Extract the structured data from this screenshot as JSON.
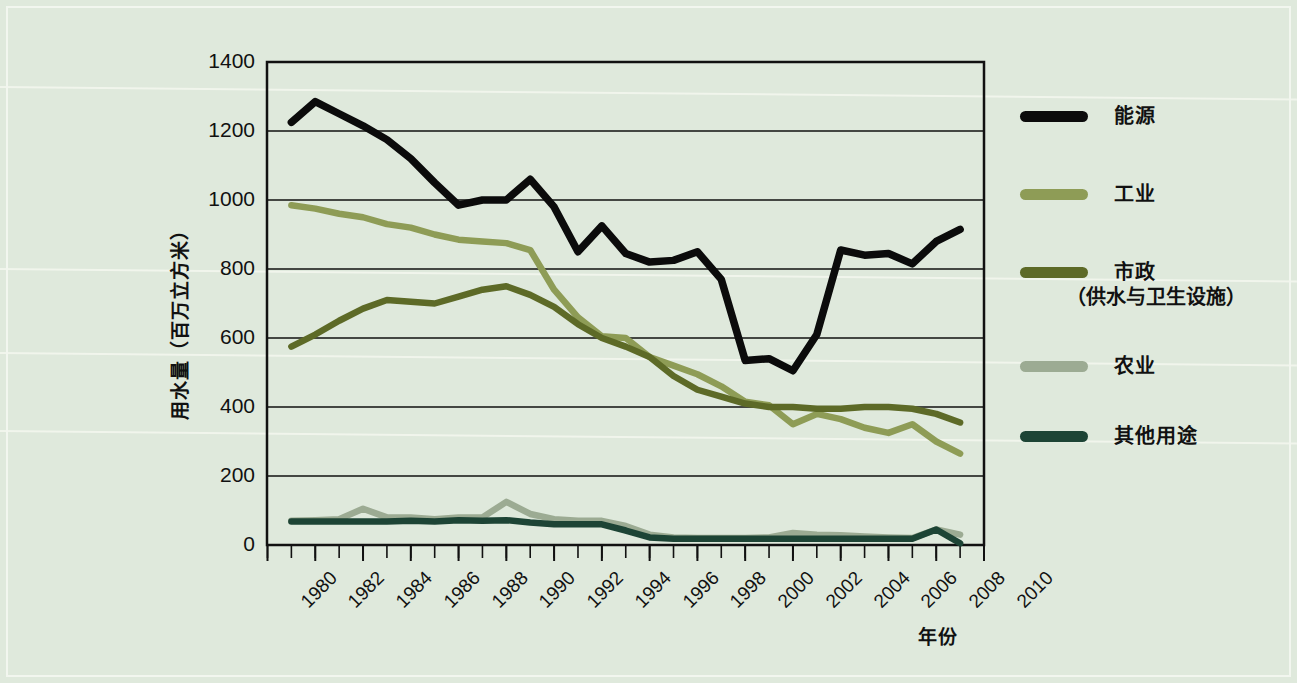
{
  "chart_data": {
    "type": "line",
    "title": "",
    "xlabel": "年份",
    "ylabel": "用水量（百万立方米）",
    "xlim": [
      1980,
      2010
    ],
    "ylim": [
      0,
      1400
    ],
    "ytick_labels": [
      "0",
      "200",
      "400",
      "600",
      "800",
      "1000",
      "1200",
      "1400"
    ],
    "ytick_values": [
      0,
      200,
      400,
      600,
      800,
      1000,
      1200,
      1400
    ],
    "xtick_labels": [
      "1980",
      "1982",
      "1984",
      "1986",
      "1988",
      "1990",
      "1992",
      "1994",
      "1996",
      "1998",
      "2000",
      "2002",
      "2004",
      "2006",
      "2008",
      "2010"
    ],
    "xtick_values": [
      1980,
      1982,
      1984,
      1986,
      1988,
      1990,
      1992,
      1994,
      1996,
      1998,
      2000,
      2002,
      2004,
      2006,
      2008,
      2010
    ],
    "minor_xticks_every": 1,
    "grid": "horizontal-only",
    "legend_position": "right",
    "x": [
      1981,
      1982,
      1983,
      1984,
      1985,
      1986,
      1987,
      1988,
      1989,
      1990,
      1991,
      1992,
      1993,
      1994,
      1995,
      1996,
      1997,
      1998,
      1999,
      2000,
      2001,
      2002,
      2003,
      2004,
      2005,
      2006,
      2007,
      2008,
      2009
    ],
    "series": [
      {
        "name": "能源",
        "color": "#0b0b0b",
        "values": [
          1225,
          1285,
          1250,
          1215,
          1175,
          1120,
          1050,
          985,
          1000,
          1000,
          1060,
          980,
          850,
          925,
          845,
          820,
          825,
          850,
          770,
          535,
          540,
          505,
          610,
          855,
          840,
          845,
          815,
          880,
          915
        ]
      },
      {
        "name": "工业",
        "color": "#8e9c56",
        "values": [
          985,
          975,
          960,
          950,
          930,
          920,
          900,
          885,
          880,
          875,
          855,
          740,
          660,
          605,
          600,
          545,
          520,
          495,
          460,
          415,
          405,
          350,
          380,
          365,
          340,
          325,
          350,
          300,
          265
        ]
      },
      {
        "name": "市政（供水与卫生设施）",
        "color": "#5d6a27",
        "values": [
          575,
          610,
          650,
          685,
          710,
          705,
          700,
          720,
          740,
          750,
          725,
          690,
          640,
          600,
          575,
          545,
          490,
          450,
          430,
          410,
          400,
          400,
          395,
          395,
          400,
          400,
          395,
          380,
          355
        ]
      },
      {
        "name": "农业",
        "color": "#9cab93",
        "values": [
          70,
          72,
          75,
          105,
          80,
          80,
          75,
          80,
          80,
          125,
          90,
          75,
          70,
          70,
          55,
          30,
          22,
          20,
          20,
          20,
          22,
          35,
          30,
          28,
          25,
          22,
          20,
          45,
          30
        ]
      },
      {
        "name": "其他用途",
        "color": "#1d4435",
        "values": [
          68,
          68,
          68,
          68,
          68,
          70,
          68,
          72,
          70,
          72,
          65,
          60,
          60,
          60,
          42,
          22,
          18,
          18,
          18,
          18,
          18,
          18,
          18,
          18,
          18,
          18,
          18,
          45,
          5
        ]
      }
    ]
  },
  "legend": {
    "items": [
      {
        "label": "能源",
        "sub": "",
        "color": "#0b0b0b"
      },
      {
        "label": "工业",
        "sub": "",
        "color": "#8e9c56"
      },
      {
        "label": "市政",
        "sub": "（供水与卫生设施）",
        "color": "#5d6a27"
      },
      {
        "label": "农业",
        "sub": "",
        "color": "#9cab93"
      },
      {
        "label": "其他用途",
        "sub": "",
        "color": "#1d4435"
      }
    ]
  },
  "colors": {
    "background": "#dfe9dc",
    "axis": "#111111",
    "gridline": "#111111"
  }
}
